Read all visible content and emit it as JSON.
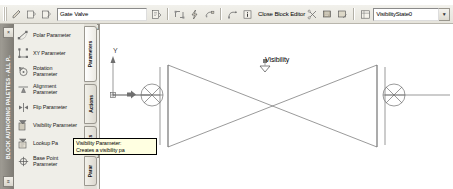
{
  "app": {
    "name": "AutoCAD Block Editor"
  },
  "toolbar": {
    "block_name_value": "Gate Valve",
    "block_name_placeholder": "Block name",
    "close_block_editor_label": "Close Block Editor",
    "visibility_state_value": "VisibilityState0",
    "left_icons": [
      {
        "name": "edit-block-definition-icon"
      },
      {
        "name": "save-block-definition-icon"
      },
      {
        "name": "save-block-as-icon"
      }
    ],
    "mid_icons": [
      {
        "name": "authoring-palettes-icon"
      },
      {
        "name": "parameter-icon"
      },
      {
        "name": "action-icon"
      },
      {
        "name": "define-attribute-icon"
      },
      {
        "name": "update-parameter-icon"
      },
      {
        "name": "learn-about-dynamic-blocks-icon"
      }
    ],
    "right_icons": [
      {
        "name": "visibility-states-icon"
      },
      {
        "name": "make-invisible-icon"
      },
      {
        "name": "make-visible-icon"
      },
      {
        "name": "visibility-state-manager-icon"
      }
    ]
  },
  "palette": {
    "title": "BLOCK AUTHORING PALETTES - ALL P..",
    "close_label": "×",
    "scroll_up_label": "▲",
    "scroll_down_label": "▼",
    "items": [
      {
        "label": "Polar Parameter",
        "icon": "polar-parameter-icon"
      },
      {
        "label": "XY Parameter",
        "icon": "xy-parameter-icon"
      },
      {
        "label": "Rotation\nParameter",
        "icon": "rotation-parameter-icon"
      },
      {
        "label": "Alignment\nParameter",
        "icon": "alignment-parameter-icon"
      },
      {
        "label": "Flip Parameter",
        "icon": "flip-parameter-icon"
      },
      {
        "label": "Visibility Parameter",
        "icon": "visibility-parameter-icon"
      },
      {
        "label": "Lookup Pa",
        "icon": "lookup-parameter-icon"
      },
      {
        "label": "Base Point\nParameter",
        "icon": "base-point-parameter-icon"
      }
    ],
    "tabs": [
      {
        "label": "Parameters",
        "active": true
      },
      {
        "label": "Actions",
        "active": false
      },
      {
        "label": "Sets",
        "active": false
      },
      {
        "label": "Parar",
        "active": false
      }
    ]
  },
  "tooltip": {
    "title": "Visibility Parameter:",
    "body": "Creates a visibility pa"
  },
  "canvas": {
    "visibility_grip_label": "Visibility",
    "ucs_y_label": "Y",
    "drawing_name": "gate-valve-symbol"
  },
  "colors": {
    "toolbar_bg": "#ece9e1",
    "palette_bg": "#efeee8",
    "tooltip_bg": "#ffffe1",
    "geometry": "#6b6b6b",
    "canvas_bg": "#ffffff"
  }
}
